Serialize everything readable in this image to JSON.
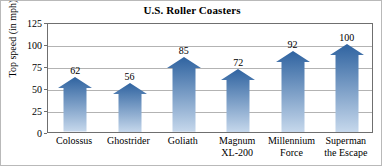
{
  "chart_data": {
    "type": "bar",
    "title": "U.S. Roller Coasters",
    "xlabel": "",
    "ylabel": "Top speed (in mph)",
    "ylim": [
      0,
      125
    ],
    "yticks": [
      0,
      25,
      50,
      75,
      100,
      125
    ],
    "grid": true,
    "legend": false,
    "categories": [
      "Colossus",
      "Ghostrider",
      "Goliath",
      "Magnum XL-200",
      "Millennium Force",
      "Superman the Escape"
    ],
    "category_lines": [
      [
        "Colossus"
      ],
      [
        "Ghostrider"
      ],
      [
        "Goliath"
      ],
      [
        "Magnum",
        "XL-200"
      ],
      [
        "Millennium",
        "Force"
      ],
      [
        "Superman",
        "the Escape"
      ]
    ],
    "values": [
      62,
      56,
      85,
      72,
      92,
      100
    ],
    "value_labels": [
      "62",
      "56",
      "85",
      "72",
      "92",
      "100"
    ],
    "bar_style": "arrow",
    "colors": {
      "bar_top": "#2f63a0",
      "bar_bottom": "#c6d8ec",
      "gridline": "#b3b3b3",
      "axis": "#6f6f6f",
      "text": "#000000",
      "background": "#ffffff"
    }
  }
}
